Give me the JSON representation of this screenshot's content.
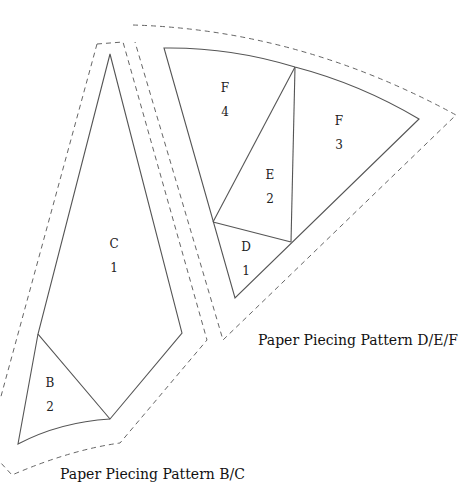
{
  "patterns": [
    {
      "caption": "Paper Piecing Pattern B/C",
      "pieces": [
        {
          "letter": "C",
          "number": "1"
        },
        {
          "letter": "B",
          "number": "2"
        }
      ]
    },
    {
      "caption": "Paper Piecing Pattern D/E/F",
      "pieces": [
        {
          "letter": "F",
          "number": "4"
        },
        {
          "letter": "F",
          "number": "3"
        },
        {
          "letter": "E",
          "number": "2"
        },
        {
          "letter": "D",
          "number": "1"
        }
      ]
    }
  ],
  "colors": {
    "line": "#555555",
    "dash": "#666666",
    "text": "#111111",
    "background": "#ffffff"
  }
}
